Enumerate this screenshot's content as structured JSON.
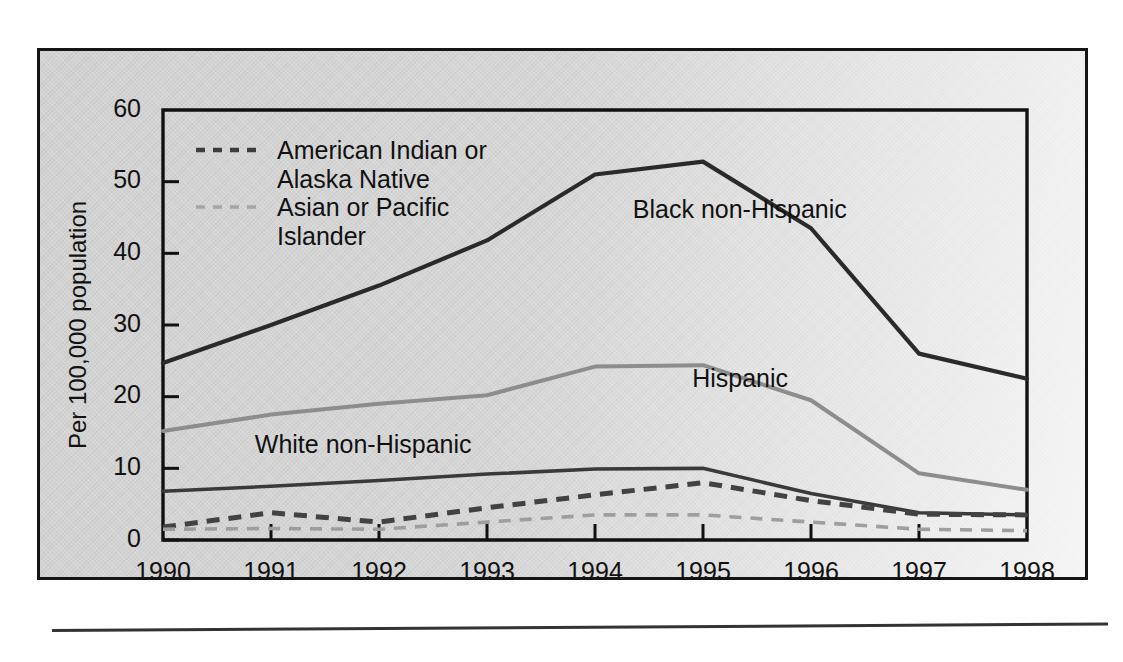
{
  "figure": {
    "background_color": "#d2d2d2",
    "page_color": "#ffffff",
    "border_color": "#151515"
  },
  "chart_data": {
    "type": "line",
    "title": "",
    "subtitle": "",
    "xlabel": "",
    "ylabel": "Per 100,000 population",
    "x": [
      1990,
      1991,
      1992,
      1993,
      1994,
      1995,
      1996,
      1997,
      1998
    ],
    "categories": [
      "1990",
      "1991",
      "1992",
      "1993",
      "1994",
      "1995",
      "1996",
      "1997",
      "1998"
    ],
    "xlim": [
      1990,
      1998
    ],
    "ylim": [
      0,
      60
    ],
    "yticks": [
      0,
      10,
      20,
      30,
      40,
      50,
      60
    ],
    "ytick_labels": [
      "0",
      "10",
      "20",
      "30",
      "40",
      "50",
      "60"
    ],
    "xticks": [
      1990,
      1991,
      1992,
      1993,
      1994,
      1995,
      1996,
      1997,
      1998
    ],
    "xtick_labels": [
      "1990",
      "1991",
      "1992",
      "1993",
      "1994",
      "1995",
      "1996",
      "1997",
      "1998"
    ],
    "grid": false,
    "legend_position": "upper-left-inside",
    "series": [
      {
        "name": "Black non-Hispanic",
        "label_style": "inline",
        "color": "#2a2a2a",
        "dash": "solid",
        "values": [
          24.7,
          30.0,
          35.5,
          41.8,
          51.0,
          52.8,
          43.5,
          26.0,
          22.5
        ]
      },
      {
        "name": "Hispanic",
        "label_style": "inline",
        "color": "#8d8d8d",
        "dash": "solid",
        "values": [
          15.2,
          17.5,
          19.0,
          20.2,
          24.2,
          24.4,
          19.5,
          9.3,
          7.0
        ]
      },
      {
        "name": "White non-Hispanic",
        "label_style": "inline",
        "color": "#3a3a3a",
        "dash": "solid",
        "values": [
          6.8,
          7.5,
          8.3,
          9.2,
          9.9,
          10.0,
          6.5,
          3.8,
          3.5
        ]
      },
      {
        "name": "American Indian or Alaska Native",
        "label_style": "legend",
        "color": "#424242",
        "dash": "dashed",
        "values": [
          1.8,
          3.8,
          2.5,
          4.5,
          6.3,
          8.0,
          5.5,
          3.6,
          3.5
        ]
      },
      {
        "name": "Asian or Pacific Islander",
        "label_style": "legend",
        "color": "#9e9e9e",
        "dash": "dashed",
        "values": [
          1.5,
          1.6,
          1.5,
          2.5,
          3.5,
          3.5,
          2.5,
          1.5,
          1.3
        ]
      }
    ],
    "annotations": [
      {
        "text": "Black non-Hispanic",
        "x": 1994.35,
        "y": 45.0
      },
      {
        "text": "Hispanic",
        "x": 1994.9,
        "y": 21.4
      },
      {
        "text": "White non-Hispanic",
        "x": 1990.85,
        "y": 12.2
      }
    ]
  },
  "legend": {
    "entries": [
      {
        "label_line1": "American Indian or",
        "label_line2": "Alaska Native",
        "style": "dashed-dark"
      },
      {
        "label_line1": "Asian or Pacific",
        "label_line2": "Islander",
        "style": "dashed-light"
      }
    ]
  }
}
